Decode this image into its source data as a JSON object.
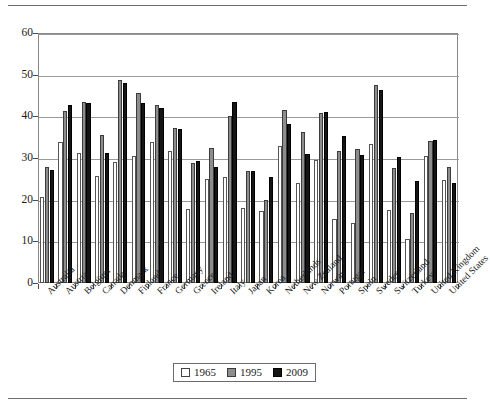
{
  "chart_data": {
    "type": "bar",
    "title": "",
    "xlabel": "",
    "ylabel": "",
    "ylim": [
      0,
      60
    ],
    "yticks": [
      0,
      10,
      20,
      30,
      40,
      50,
      60
    ],
    "grid": true,
    "legend_position": "bottom-center",
    "categories": [
      "Australia",
      "Austria",
      "Belgium",
      "Canada",
      "Denmark",
      "Finland",
      "France",
      "Germany",
      "Greece",
      "Ireland",
      "Italy",
      "Japan",
      "Korea",
      "Netherlands",
      "New Zealand",
      "Norway",
      "Portugal",
      "Spain",
      "Sweden",
      "Switzerland",
      "Turkey",
      "United Kingdom",
      "United States"
    ],
    "series": [
      {
        "name": "1965",
        "color": "#ffffff",
        "values": [
          20.6,
          33.9,
          31.1,
          25.6,
          29.1,
          30.4,
          33.9,
          31.6,
          17.8,
          24.9,
          25.5,
          18.0,
          17.2,
          32.8,
          24.0,
          29.6,
          15.3,
          14.3,
          33.3,
          17.5,
          10.6,
          30.4,
          24.7
        ]
      },
      {
        "name": "1995",
        "color": "#8d8d8d",
        "values": [
          27.8,
          41.3,
          43.5,
          35.6,
          48.8,
          45.7,
          42.7,
          37.2,
          28.9,
          32.5,
          40.1,
          26.8,
          20.0,
          41.5,
          36.2,
          40.9,
          31.7,
          32.1,
          47.5,
          27.7,
          16.8,
          34.0,
          27.9
        ]
      },
      {
        "name": "2009",
        "color": "#151515",
        "values": [
          27.1,
          42.7,
          43.2,
          31.1,
          48.1,
          43.1,
          41.9,
          37.0,
          29.4,
          27.8,
          43.4,
          26.9,
          25.5,
          38.2,
          31.0,
          41.0,
          35.2,
          30.7,
          46.4,
          30.3,
          24.6,
          34.3,
          24.0
        ]
      }
    ]
  },
  "legend": {
    "items": [
      {
        "label": "1965"
      },
      {
        "label": "1995"
      },
      {
        "label": "2009"
      }
    ]
  }
}
